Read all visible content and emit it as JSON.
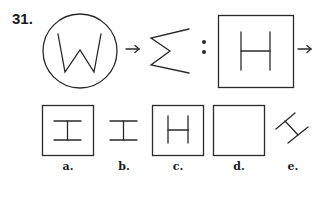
{
  "question": {
    "number": "31."
  },
  "analogy": {
    "first_pair": {
      "source": "W in circle",
      "arrow": "→",
      "target": "Σ (sideways W)"
    },
    "separator": ":",
    "second_pair": {
      "source": "H in square",
      "arrow": "→",
      "target": "?"
    }
  },
  "options": [
    {
      "label": "a.",
      "description": "rotated H (I-shape) in square"
    },
    {
      "label": "b.",
      "description": "rotated H (I-shape) without square"
    },
    {
      "label": "c.",
      "description": "smaller H in square"
    },
    {
      "label": "d.",
      "description": "empty square"
    },
    {
      "label": "e.",
      "description": "tilted H without square"
    }
  ]
}
